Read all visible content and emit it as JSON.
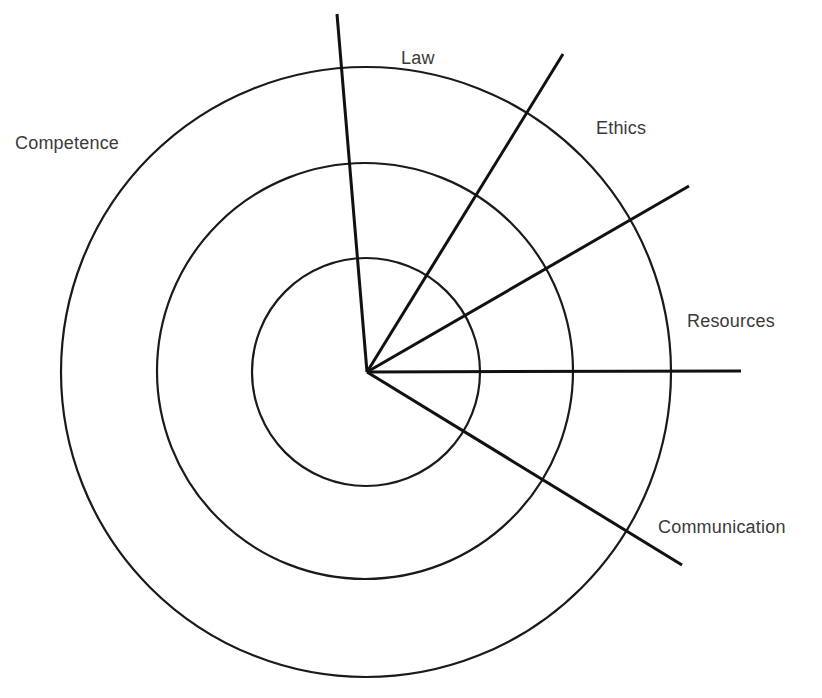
{
  "diagram": {
    "type": "concentric-rings-with-radial-spokes",
    "center": {
      "x": 367,
      "y": 372
    },
    "colors": {
      "background": "#ffffff",
      "line": "#111111",
      "label": "#3a3a3a"
    },
    "rings": [
      {
        "name": "inner-ring",
        "cx": 366,
        "cy": 372,
        "r": 114
      },
      {
        "name": "middle-ring",
        "cx": 365,
        "cy": 371,
        "r": 208
      },
      {
        "name": "outer-ring",
        "cx": 366,
        "cy": 372,
        "r": 305
      }
    ],
    "spokes": [
      {
        "name": "law-spoke",
        "x2": 337,
        "y2": 14
      },
      {
        "name": "ethics-spoke",
        "x2": 563,
        "y2": 54
      },
      {
        "name": "resources-upper-spoke",
        "x2": 689,
        "y2": 186
      },
      {
        "name": "resources-spoke",
        "x2": 741,
        "y2": 371
      },
      {
        "name": "communication-spoke",
        "x2": 682,
        "y2": 565
      }
    ],
    "labels": [
      {
        "name": "label-competence",
        "text": "Competence",
        "x": 15,
        "y": 134
      },
      {
        "name": "label-law",
        "text": "Law",
        "x": 401,
        "y": 49
      },
      {
        "name": "label-ethics",
        "text": "Ethics",
        "x": 596,
        "y": 119
      },
      {
        "name": "label-resources",
        "text": "Resources",
        "x": 687,
        "y": 312
      },
      {
        "name": "label-communication",
        "text": "Communication",
        "x": 658,
        "y": 518
      }
    ]
  }
}
